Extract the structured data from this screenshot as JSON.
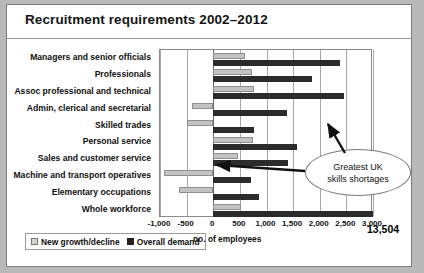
{
  "header": {
    "title": "Recruitment requirements 2002–2012"
  },
  "chart_data": {
    "type": "bar",
    "orientation": "horizontal",
    "title": "Recruitment requirements 2002–2012",
    "xlabel": "no. of employees",
    "ylabel": "",
    "xlim": [
      -1000,
      3000
    ],
    "xticks": [
      "-1,000",
      "-500",
      "0",
      "500",
      "1,000",
      "1,500",
      "2,000",
      "2,500",
      "3,000"
    ],
    "xtick_values": [
      -1000,
      -500,
      0,
      500,
      1000,
      1500,
      2000,
      2500,
      3000
    ],
    "grid": true,
    "legend_position": "bottom-left",
    "categories": [
      "Managers and senior officials",
      "Professionals",
      "Assoc professional and technical",
      "Admin, clerical and secretarial",
      "Skilled trades",
      "Personal service",
      "Sales and customer service",
      "Machine and transport operatives",
      "Elementary occupations",
      "Whole workforce"
    ],
    "series": [
      {
        "name": "New growth/decline",
        "color": "#c2c2c2",
        "values": [
          590,
          730,
          770,
          -400,
          -500,
          740,
          460,
          -920,
          -640,
          530
        ]
      },
      {
        "name": "Overall demand",
        "color": "#2b2b2b",
        "values": [
          2380,
          1850,
          2460,
          1380,
          770,
          1580,
          1400,
          700,
          850,
          13504
        ]
      }
    ],
    "annotations": [
      {
        "text": "Greatest UK skills shortages",
        "lines": [
          "Greatest UK",
          "skills shortages"
        ],
        "shape": "ellipse",
        "points_to": [
          "Assoc professional and technical",
          "Skilled trades"
        ]
      },
      {
        "text": "13,504",
        "attached_to": "Whole workforce",
        "series": "Overall demand",
        "note": "value exceeds axis maximum"
      }
    ]
  },
  "legend": {
    "items": [
      {
        "label": "New growth/decline",
        "swatch": "light-gray"
      },
      {
        "label": "Overall demand",
        "swatch": "black"
      }
    ]
  },
  "axis": {
    "x_caption": "no. of employees"
  }
}
